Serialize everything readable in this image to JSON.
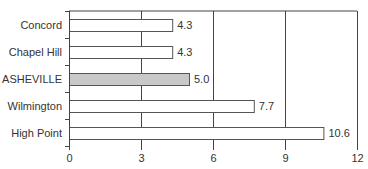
{
  "chart_data": {
    "type": "bar",
    "orientation": "horizontal",
    "title": "",
    "xlabel": "",
    "ylabel": "",
    "categories": [
      "Concord",
      "Chapel Hill",
      "ASHEVILLE",
      "Wilmington",
      "High Point"
    ],
    "values": [
      4.3,
      4.3,
      5.0,
      7.7,
      10.6
    ],
    "value_labels": [
      "4.3",
      "4.3",
      "5.0",
      "7.7",
      "10.6"
    ],
    "highlighted": "ASHEVILLE",
    "xlim": [
      0,
      12
    ],
    "x_ticks": [
      0,
      3,
      6,
      9,
      12
    ],
    "x_tick_labels": [
      "0",
      "3",
      "6",
      "9",
      "12"
    ],
    "grid": "vertical",
    "legend": "none"
  },
  "colors": {
    "bar_fill": "#ffffff",
    "bar_highlight_fill": "#c8c8c8",
    "bar_stroke": "#555555",
    "grid": "#444444",
    "text": "#333333"
  }
}
